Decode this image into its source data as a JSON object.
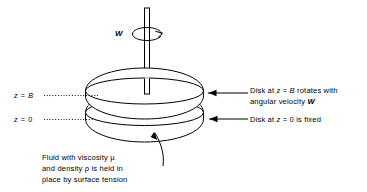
{
  "figure": {
    "type": "physics-diagram",
    "background_color": "#ffffff",
    "stroke_color": "#000000"
  },
  "axis_labels": {
    "top": "z = B",
    "bottom": "z = 0"
  },
  "shaft": {
    "label": "W",
    "rotation_symbol": "curved-rotation-arrow"
  },
  "annotations": {
    "top_disk": {
      "line1": "Disk at z = B rotates with",
      "line2": "angular velocity W"
    },
    "bottom_disk": {
      "line1": "Disk at z = 0 is fixed"
    },
    "fluid": {
      "line1": "Fluid with viscosity µ",
      "line2": "and density ρ is held in",
      "line3": "place by surface tension"
    }
  },
  "symbols": {
    "viscosity": "µ",
    "density": "ρ",
    "angular_velocity": "W",
    "gap_height": "B",
    "coordinate": "z"
  }
}
